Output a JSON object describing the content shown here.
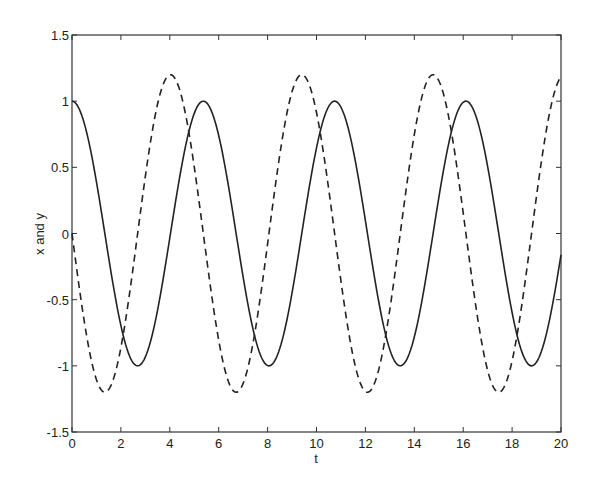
{
  "chart_data": {
    "type": "line",
    "title": "",
    "xlabel": "t",
    "ylabel": "x and y",
    "xlim": [
      0,
      20
    ],
    "ylim": [
      -1.5,
      1.5
    ],
    "grid": false,
    "legend": null,
    "x_ticks": [
      "0",
      "2",
      "4",
      "6",
      "8",
      "10",
      "12",
      "14",
      "16",
      "18",
      "20"
    ],
    "y_ticks": [
      "-1.5",
      "-1",
      "-0.5",
      "0",
      "0.5",
      "1",
      "1.5"
    ],
    "x_tick_values": [
      0,
      2,
      4,
      6,
      8,
      10,
      12,
      14,
      16,
      18,
      20
    ],
    "y_tick_values": [
      -1.5,
      -1,
      -0.5,
      0,
      0.5,
      1,
      1.5
    ],
    "series": [
      {
        "name": "x",
        "style": "solid",
        "color": "#222222",
        "model": {
          "kind": "cos",
          "amplitude": 1.0,
          "omega": 1.17,
          "phase": 0
        },
        "x": [
          0,
          1,
          2,
          2.7,
          4,
          5.4,
          6,
          7,
          8.1,
          9,
          10.8,
          12,
          13.5,
          15,
          16.2,
          17,
          18.9,
          20
        ],
        "values": [
          1.0,
          0.39,
          -0.69,
          -1.0,
          -0.07,
          1.0,
          0.71,
          -0.32,
          -1.0,
          -0.48,
          1.0,
          0.05,
          -1.0,
          0.29,
          1.0,
          0.52,
          -1.0,
          -0.16
        ]
      },
      {
        "name": "y",
        "style": "dashed",
        "color": "#222222",
        "model": {
          "kind": "negsin",
          "amplitude": 1.2,
          "omega": 1.17,
          "phase": 0
        },
        "x": [
          0,
          1.35,
          2.7,
          4.05,
          5.4,
          6.75,
          8.1,
          9.45,
          10.8,
          12.15,
          13.5,
          14.8,
          16.2,
          17.5,
          18.9,
          20
        ],
        "values": [
          0.0,
          -1.2,
          0.0,
          1.2,
          0.0,
          -1.2,
          0.0,
          1.2,
          0.0,
          -1.2,
          0.0,
          1.2,
          0.0,
          -1.2,
          0.0,
          1.18
        ]
      }
    ]
  },
  "colors": {
    "axis": "#333333",
    "line": "#222222",
    "background": "#ffffff"
  }
}
